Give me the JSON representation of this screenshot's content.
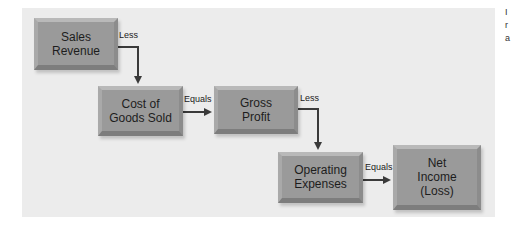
{
  "diagram": {
    "title": "",
    "nodes": [
      {
        "id": "sales_revenue",
        "lines": [
          "Sales",
          "Revenue"
        ]
      },
      {
        "id": "cogs",
        "lines": [
          "Cost of",
          "Goods Sold"
        ]
      },
      {
        "id": "gross_profit",
        "lines": [
          "Gross",
          "Profit"
        ]
      },
      {
        "id": "operating_expenses",
        "lines": [
          "Operating",
          "Expenses"
        ]
      },
      {
        "id": "net_income",
        "lines": [
          "Net",
          "Income",
          "(Loss)"
        ]
      }
    ],
    "edges": [
      {
        "from": "sales_revenue",
        "to": "cogs",
        "label": "Less"
      },
      {
        "from": "cogs",
        "to": "gross_profit",
        "label": "Equals"
      },
      {
        "from": "gross_profit",
        "to": "operating_expenses",
        "label": "Less"
      },
      {
        "from": "operating_expenses",
        "to": "net_income",
        "label": "Equals"
      }
    ],
    "colors": {
      "panel": "#ececec",
      "box": "#9a9a9a",
      "arrow": "#3a3a3a",
      "text": "#1d1d1d"
    }
  },
  "cropped_edge_text": [
    "I",
    "r",
    "a"
  ]
}
